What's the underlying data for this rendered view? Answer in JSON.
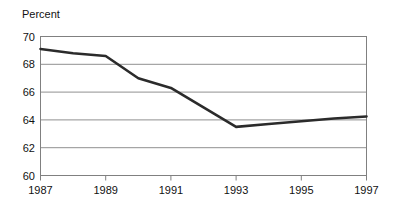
{
  "chart_data": {
    "type": "line",
    "title": "",
    "ylabel": "Percent",
    "xlabel": "",
    "ylim": [
      60,
      70
    ],
    "xlim": [
      1987,
      1997
    ],
    "yticks": [
      60,
      62,
      64,
      66,
      68,
      70
    ],
    "ytick_labels": [
      "60",
      "62",
      "64",
      "66",
      "68",
      "70"
    ],
    "xticks": [
      1987,
      1989,
      1991,
      1993,
      1995,
      1997
    ],
    "xtick_labels": [
      "1987",
      "1989",
      "1991",
      "1993",
      "1995",
      "1997"
    ],
    "grid": "horizontal",
    "legend": "none",
    "line_color": "#2b2b2b",
    "line_width": 2.6,
    "x": [
      1987,
      1988,
      1989,
      1990,
      1991,
      1992,
      1993,
      1994,
      1995,
      1996,
      1997
    ],
    "values": [
      69.1,
      68.8,
      68.6,
      67.0,
      66.3,
      64.9,
      63.5,
      63.7,
      63.9,
      64.1,
      64.25
    ],
    "series": [
      {
        "name": "Percent",
        "values": [
          69.1,
          68.8,
          68.6,
          67.0,
          66.3,
          64.9,
          63.5,
          63.7,
          63.9,
          64.1,
          64.25
        ]
      }
    ]
  },
  "axes": {
    "frame_color": "#808080",
    "gridline_color": "#909090",
    "background": "#ffffff"
  }
}
